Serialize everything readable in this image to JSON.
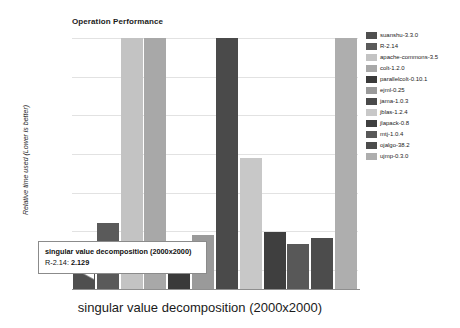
{
  "chart_data": {
    "type": "bar",
    "title": "Operation Performance",
    "xlabel": "singular value decomposition (2000x2000)",
    "ylabel": "Relative time used (Lower is better)",
    "grid": true,
    "legend_position": "right",
    "ylim": [
      0,
      8
    ],
    "gridline_count": 7,
    "categories": [
      "suanshu-3.3.0",
      "R-2.14",
      "apache-commons-3.5",
      "colt-1.2.0",
      "parallelcolt-0.10.1",
      "ejml-0.25",
      "jama-1.0.3",
      "jblas-1.2.4",
      "jlapack-0.8",
      "mtj-1.0.4",
      "ojalgo-38.2",
      "ujmp-0.3.0"
    ],
    "values": [
      0.6,
      2.129,
      8.6,
      8.6,
      1.55,
      1.75,
      8.6,
      4.2,
      1.85,
      1.45,
      1.65,
      8.6
    ],
    "clipped": [
      false,
      false,
      true,
      true,
      false,
      false,
      true,
      false,
      false,
      false,
      false,
      true
    ],
    "colors": [
      "#4f4f4f",
      "#5a5a5a",
      "#c3c3c3",
      "#a8a8a8",
      "#3a3a3a",
      "#9a9a9a",
      "#4a4a4a",
      "#c8c8c8",
      "#3f3f3f",
      "#585858",
      "#4c4c4c",
      "#aeaeae"
    ]
  },
  "tooltip": {
    "title": "singular value decomposition (2000x2000)",
    "series": "R-2.14:",
    "value": "2.129"
  },
  "legend": {
    "items": [
      {
        "label": "suanshu-3.3.0",
        "color": "#4f4f4f"
      },
      {
        "label": "R-2.14",
        "color": "#5a5a5a"
      },
      {
        "label": "apache-commons-3.5",
        "color": "#c3c3c3"
      },
      {
        "label": "colt-1.2.0",
        "color": "#a8a8a8"
      },
      {
        "label": "parallelcolt-0.10.1",
        "color": "#3a3a3a"
      },
      {
        "label": "ejml-0.25",
        "color": "#9a9a9a"
      },
      {
        "label": "jama-1.0.3",
        "color": "#4a4a4a"
      },
      {
        "label": "jblas-1.2.4",
        "color": "#c8c8c8"
      },
      {
        "label": "jlapack-0.8",
        "color": "#3f3f3f"
      },
      {
        "label": "mtj-1.0.4",
        "color": "#585858"
      },
      {
        "label": "ojalgo-38.2",
        "color": "#4c4c4c"
      },
      {
        "label": "ujmp-0.3.0",
        "color": "#aeaeae"
      }
    ]
  }
}
